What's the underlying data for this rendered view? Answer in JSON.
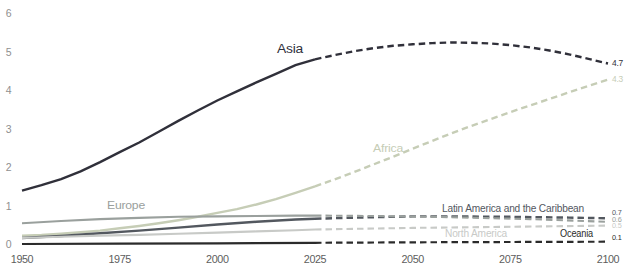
{
  "chart_data": {
    "type": "line",
    "xlim": [
      1950,
      2100
    ],
    "ylim": [
      0,
      6
    ],
    "x_ticks": [
      1950,
      1975,
      2000,
      2025,
      2050,
      2075,
      2100
    ],
    "y_ticks": [
      0,
      1,
      2,
      3,
      4,
      5,
      6
    ],
    "grid": false,
    "legend_position": "inline-labels",
    "projection_start": 2025,
    "projection_style": "dashed",
    "series": [
      {
        "name": "Asia",
        "color": "#30303a",
        "stroke_width": 2.4,
        "end_label": "4.7",
        "x": [
          1950,
          1955,
          1960,
          1965,
          1970,
          1975,
          1980,
          1985,
          1990,
          1995,
          2000,
          2005,
          2010,
          2015,
          2020,
          2025,
          2030,
          2035,
          2040,
          2045,
          2050,
          2055,
          2060,
          2065,
          2070,
          2075,
          2080,
          2085,
          2090,
          2095,
          2100
        ],
        "values": [
          1.4,
          1.54,
          1.7,
          1.9,
          2.14,
          2.4,
          2.65,
          2.93,
          3.21,
          3.48,
          3.74,
          3.98,
          4.21,
          4.43,
          4.66,
          4.81,
          4.92,
          5.02,
          5.1,
          5.16,
          5.2,
          5.23,
          5.25,
          5.24,
          5.22,
          5.18,
          5.12,
          5.04,
          4.94,
          4.82,
          4.7
        ]
      },
      {
        "name": "Africa",
        "color": "#c6cdb6",
        "stroke_width": 2.4,
        "end_label": "4.3",
        "x": [
          1950,
          1955,
          1960,
          1965,
          1970,
          1975,
          1980,
          1985,
          1990,
          1995,
          2000,
          2005,
          2010,
          2015,
          2020,
          2025,
          2030,
          2035,
          2040,
          2045,
          2050,
          2055,
          2060,
          2065,
          2070,
          2075,
          2080,
          2085,
          2090,
          2095,
          2100
        ],
        "values": [
          0.23,
          0.25,
          0.28,
          0.32,
          0.36,
          0.42,
          0.48,
          0.55,
          0.63,
          0.72,
          0.82,
          0.92,
          1.04,
          1.18,
          1.34,
          1.51,
          1.69,
          1.88,
          2.08,
          2.28,
          2.49,
          2.69,
          2.89,
          3.08,
          3.26,
          3.44,
          3.61,
          3.78,
          3.95,
          4.12,
          4.28
        ]
      },
      {
        "name": "Latin America and the Caribbean",
        "color": "#53585f",
        "stroke_width": 2.4,
        "end_label": "0.7",
        "x": [
          1950,
          1960,
          1970,
          1980,
          1990,
          2000,
          2010,
          2020,
          2025,
          2040,
          2050,
          2060,
          2075,
          2090,
          2100
        ],
        "values": [
          0.17,
          0.22,
          0.29,
          0.36,
          0.44,
          0.52,
          0.59,
          0.65,
          0.67,
          0.71,
          0.73,
          0.73,
          0.72,
          0.7,
          0.68
        ]
      },
      {
        "name": "Europe",
        "color": "#9aa09d",
        "stroke_width": 2.1,
        "end_label": "0.6",
        "x": [
          1950,
          1960,
          1970,
          1980,
          1990,
          2000,
          2010,
          2020,
          2025,
          2040,
          2060,
          2080,
          2100
        ],
        "values": [
          0.55,
          0.61,
          0.66,
          0.69,
          0.72,
          0.73,
          0.74,
          0.75,
          0.75,
          0.74,
          0.71,
          0.66,
          0.59
        ]
      },
      {
        "name": "North America",
        "color": "#c8cac7",
        "stroke_width": 2.1,
        "end_label": "0.5",
        "x": [
          1950,
          1960,
          1970,
          1980,
          1990,
          2000,
          2010,
          2020,
          2025,
          2050,
          2075,
          2100
        ],
        "values": [
          0.17,
          0.2,
          0.23,
          0.25,
          0.28,
          0.31,
          0.34,
          0.37,
          0.39,
          0.43,
          0.46,
          0.49
        ]
      },
      {
        "name": "Oceania",
        "color": "#2b2b2b",
        "stroke_width": 2.2,
        "end_label": "0.1",
        "x": [
          1950,
          1975,
          2000,
          2025,
          2050,
          2075,
          2100
        ],
        "values": [
          0.013,
          0.021,
          0.031,
          0.045,
          0.057,
          0.065,
          0.072
        ]
      }
    ]
  }
}
